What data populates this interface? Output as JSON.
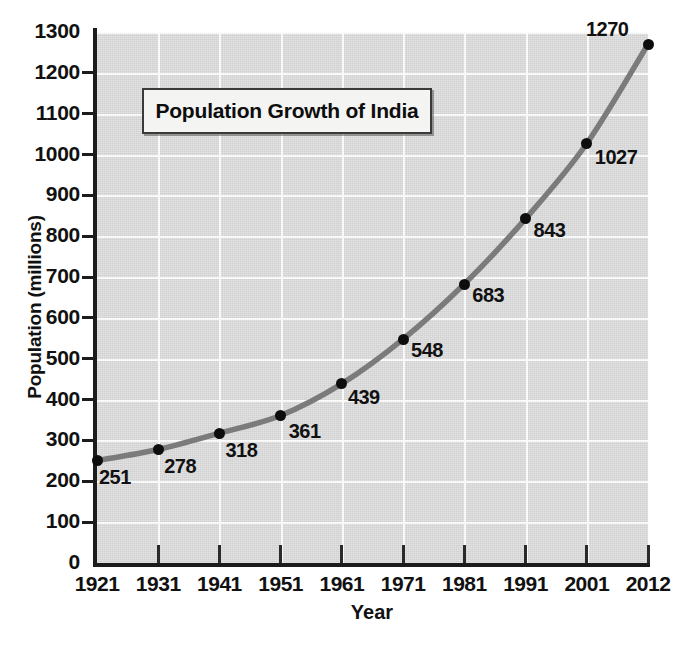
{
  "chart_data": {
    "type": "line",
    "title": "Population Growth of India",
    "xlabel": "Year",
    "ylabel": "Population (millions)",
    "categories": [
      "1921",
      "1931",
      "1941",
      "1951",
      "1961",
      "1971",
      "1981",
      "1991",
      "2001",
      "2012"
    ],
    "values": [
      251,
      278,
      318,
      361,
      439,
      548,
      683,
      843,
      1027,
      1270
    ],
    "point_labels": [
      "251",
      "278",
      "318",
      "361",
      "439",
      "548",
      "683",
      "843",
      "1027",
      "1270"
    ],
    "x_tick_labels": [
      "1921",
      "1931",
      "1941",
      "1951",
      "1961",
      "1971",
      "1981",
      "1991",
      "2001",
      "2012"
    ],
    "y_tick_labels": [
      "0",
      "100",
      "200",
      "300",
      "400",
      "500",
      "600",
      "700",
      "800",
      "900",
      "1000",
      "1100",
      "1200",
      "1300"
    ],
    "y_tick_values": [
      0,
      100,
      200,
      300,
      400,
      500,
      600,
      700,
      800,
      900,
      1000,
      1100,
      1200,
      1300
    ],
    "ylim": [
      0,
      1300
    ],
    "xlim": [
      1921,
      2012
    ],
    "grid": true,
    "legend": "none",
    "series": [
      {
        "name": "Population of India",
        "values": [
          251,
          278,
          318,
          361,
          439,
          548,
          683,
          843,
          1027,
          1270
        ]
      }
    ],
    "colors": {
      "plot_background": "#d9d9d9",
      "gridline": "#fdfdfd",
      "axis": "#1c1c1c",
      "line": "#7b7b7b",
      "marker": "#0d0d0d",
      "text": "#111111",
      "title_box_background": "#f4f4f2",
      "title_box_border": "#3a3a3a",
      "page_background": "#ffffff"
    }
  }
}
